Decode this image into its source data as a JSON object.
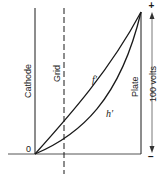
{
  "diagram": {
    "title": "",
    "labels": {
      "cathode": "Cathode",
      "grid": "Grid",
      "plate": "Plate",
      "voltage": "100 volts",
      "origin": "0",
      "plus": "+",
      "minus": "−"
    },
    "curves": [
      {
        "name": "f'",
        "label": "f′",
        "description": "potential curve, more strongly rising"
      },
      {
        "name": "h'",
        "label": "h′",
        "description": "potential curve, lower (space-charge limited)"
      }
    ],
    "colors": {
      "line": "#1a1a1a",
      "dim_line": "#555555",
      "background": "#ffffff"
    }
  }
}
